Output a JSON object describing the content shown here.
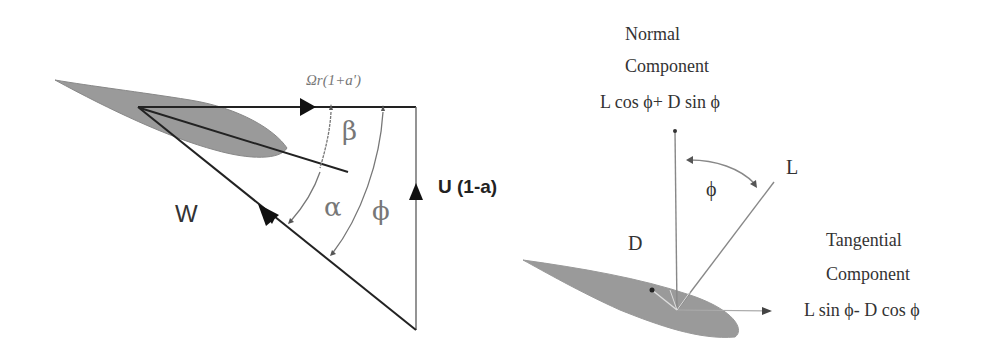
{
  "left_diagram": {
    "rotational_velocity_label": "Ωr(1+a')",
    "axial_velocity_label": "U (1-a)",
    "relative_wind_label": "W",
    "beta_label": "β",
    "alpha_label": "α",
    "phi_label": "ϕ"
  },
  "right_diagram": {
    "normal_title_1": "Normal",
    "normal_title_2": "Component",
    "normal_formula": "L cos ϕ+ D sin ϕ",
    "lift_label": "L",
    "drag_label": "D",
    "phi_label": "ϕ",
    "tangential_title_1": "Tangential",
    "tangential_title_2": "Component",
    "tangential_formula": "L sin ϕ- D cos ϕ"
  },
  "colors": {
    "airfoil_fill": "#9a9a9a",
    "line": "#222222",
    "light_line": "#888888",
    "text": "#333333"
  }
}
